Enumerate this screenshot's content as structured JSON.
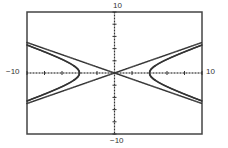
{
  "chart_data": {
    "type": "line",
    "title": "",
    "xlabel": "",
    "ylabel": "",
    "xlim": [
      -10,
      10
    ],
    "ylim": [
      -10,
      10
    ],
    "xscale_ticks": 2,
    "yscale_ticks": 2,
    "grid": false,
    "legend": null,
    "style": "graphing-calculator dotted pixels",
    "window_labels": {
      "xmin": "−10",
      "xmax": "10",
      "ymin": "−10",
      "ymax": "10"
    },
    "series": [
      {
        "name": "hyperbola",
        "equation": "x^2/16 - y^2/4 = 1",
        "a": 4,
        "b": 2,
        "vertices": [
          [
            -4,
            0
          ],
          [
            4,
            0
          ]
        ]
      },
      {
        "name": "asymptote-positive",
        "equation": "y = x/2",
        "slope": 0.5
      },
      {
        "name": "asymptote-negative",
        "equation": "y = -x/2",
        "slope": -0.5
      }
    ],
    "colors": {
      "plot": "#333333",
      "frame": "#444444",
      "background": "#ffffff"
    }
  },
  "frame": {
    "left": 27,
    "top": 12,
    "right": 202,
    "bottom": 134
  }
}
